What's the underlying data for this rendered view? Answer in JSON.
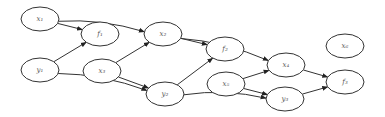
{
  "diagram": {
    "type": "directed-graph",
    "nodes": [
      {
        "id": "x1",
        "label": "x₁"
      },
      {
        "id": "f1",
        "label": "f₁"
      },
      {
        "id": "y1",
        "label": "y₁"
      },
      {
        "id": "x2",
        "label": "x₂"
      },
      {
        "id": "x3",
        "label": "x₃"
      },
      {
        "id": "y2",
        "label": "y₂"
      },
      {
        "id": "f2",
        "label": "f₂"
      },
      {
        "id": "x4",
        "label": "x₄"
      },
      {
        "id": "x5",
        "label": "x₅"
      },
      {
        "id": "y3",
        "label": "y₃"
      },
      {
        "id": "f3",
        "label": "f₃"
      },
      {
        "id": "x6",
        "label": "x₆"
      }
    ],
    "edges": [
      {
        "from": "x1",
        "to": "f1"
      },
      {
        "from": "y1",
        "to": "f1"
      },
      {
        "from": "x1",
        "to": "x2"
      },
      {
        "from": "y1",
        "to": "y2"
      },
      {
        "from": "x3",
        "to": "x2"
      },
      {
        "from": "x3",
        "to": "y2"
      },
      {
        "from": "x2",
        "to": "f2"
      },
      {
        "from": "y2",
        "to": "f2"
      },
      {
        "from": "x2",
        "to": "x4"
      },
      {
        "from": "y2",
        "to": "y3"
      },
      {
        "from": "x5",
        "to": "x4"
      },
      {
        "from": "x5",
        "to": "y3"
      },
      {
        "from": "x4",
        "to": "f3"
      },
      {
        "from": "y3",
        "to": "f3"
      }
    ]
  }
}
